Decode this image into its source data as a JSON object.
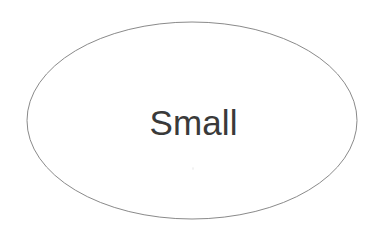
{
  "canvas": {
    "width": 385,
    "height": 242,
    "background_color": "#ffffff"
  },
  "shape": {
    "type": "ellipse",
    "name": "ellipse-outline",
    "label": "Small",
    "label_color": "#3a3a3a",
    "stroke_color": "#8a8a8a",
    "fill_color": "none",
    "stroke_width": 1,
    "center_x": 192,
    "center_y": 120.5,
    "radius_x": 165,
    "radius_y": 98.5
  },
  "artifacts": {
    "speck": {
      "x": 192,
      "y": 167
    }
  }
}
